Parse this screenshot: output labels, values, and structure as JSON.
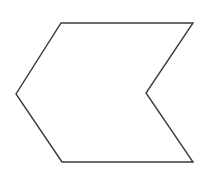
{
  "canvas": {
    "width": 211,
    "height": 174,
    "background_color": "#ffffff"
  },
  "figure": {
    "name": "concave-chevron-polygon",
    "stroke_color": "#3a3a3a",
    "fill_color": "#ffffff",
    "stroke_width": 1.4,
    "vertex_count": 6,
    "closed": true,
    "points": "61,23 193,23 146,93 193,162 62,162 16,94",
    "vertices": [
      {
        "label": "top-left",
        "x": 61,
        "y": 23
      },
      {
        "label": "top-right",
        "x": 193,
        "y": 23
      },
      {
        "label": "right-notch-apex",
        "x": 146,
        "y": 93
      },
      {
        "label": "bottom-right",
        "x": 193,
        "y": 162
      },
      {
        "label": "bottom-left",
        "x": 62,
        "y": 162
      },
      {
        "label": "left-apex",
        "x": 16,
        "y": 94
      }
    ]
  }
}
